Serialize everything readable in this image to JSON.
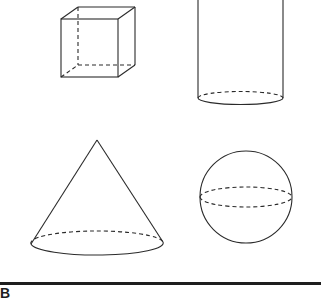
{
  "figure": {
    "shapes": [
      {
        "id": "cube",
        "name": "Cube"
      },
      {
        "id": "cylinder",
        "name": "Cylinder"
      },
      {
        "id": "cone",
        "name": "Cone"
      },
      {
        "id": "sphere",
        "name": "Sphere"
      }
    ],
    "line_color": "#2a2a2a",
    "background": "#ffffff"
  },
  "footer": {
    "partial_label": "B"
  }
}
